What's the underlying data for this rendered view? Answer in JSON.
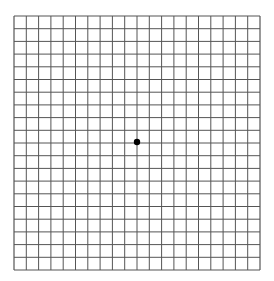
{
  "diagram": {
    "type": "amsler-grid",
    "columns": 20,
    "rows": 20,
    "grid": {
      "left": 14,
      "top": 16,
      "right": 260,
      "bottom": 270
    },
    "line_color": "#555555",
    "background_color": "#ffffff",
    "center_dot": {
      "x": 137,
      "y": 142,
      "radius": 3.2,
      "color": "#000000"
    }
  }
}
